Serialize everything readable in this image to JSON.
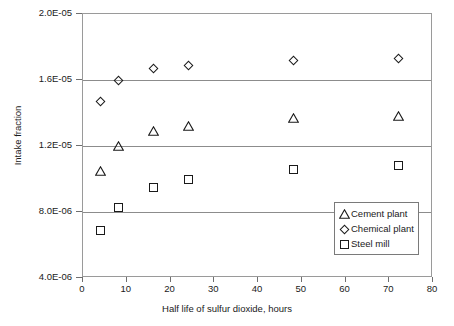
{
  "chart_data": {
    "type": "scatter",
    "title": "",
    "xlabel": "Half life of sulfur dioxide, hours",
    "ylabel": "Intake fraction",
    "xlim": [
      0,
      80
    ],
    "ylim": [
      4e-06,
      2e-05
    ],
    "xticks": [
      0,
      10,
      20,
      30,
      40,
      50,
      60,
      70,
      80
    ],
    "xtick_labels": [
      "0",
      "10",
      "20",
      "30",
      "40",
      "50",
      "60",
      "70",
      "80"
    ],
    "yticks": [
      4e-06,
      8e-06,
      1.2e-05,
      1.6e-05,
      2e-05
    ],
    "ytick_labels": [
      "4.0E-06",
      "8.0E-06",
      "1.2E-05",
      "1.6E-05",
      "2.0E-05"
    ],
    "grid": "horizontal",
    "legend_position": "bottom-right",
    "x": [
      4,
      8,
      16,
      24,
      48,
      72
    ],
    "series": [
      {
        "name": "Cement plant",
        "marker": "triangle",
        "color": "#1a1a1a",
        "values": [
          1.05e-05,
          1.2e-05,
          1.29e-05,
          1.32e-05,
          1.37e-05,
          1.38e-05
        ]
      },
      {
        "name": "Chemical plant",
        "marker": "diamond",
        "color": "#1a1a1a",
        "values": [
          1.47e-05,
          1.6e-05,
          1.67e-05,
          1.69e-05,
          1.72e-05,
          1.73e-05
        ]
      },
      {
        "name": "Steel mill",
        "marker": "square",
        "color": "#1a1a1a",
        "values": [
          6.9e-06,
          8.3e-06,
          9.5e-06,
          1e-05,
          1.06e-05,
          1.08e-05
        ]
      }
    ]
  },
  "colors": {
    "axis": "#8c8c8c",
    "gridline": "#8c8c8c",
    "marker": "#1a1a1a",
    "text": "#1a1a1a",
    "background": "#ffffff"
  }
}
